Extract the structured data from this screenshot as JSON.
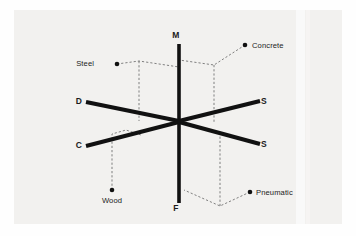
{
  "figure": {
    "background_color": "#f2f1ef",
    "frame_color": "#fdfdfd",
    "axis_color": "#111111",
    "dashed_color": "#6b6b6b",
    "marker_color": "#111111",
    "text_color": "#1b1b1b"
  },
  "axes": [
    {
      "id": "axis-m",
      "label": "M",
      "direction": "up",
      "label_x": 176,
      "label_y": 38,
      "x1": 179,
      "y1": 44,
      "x2": 179,
      "y2": 120
    },
    {
      "id": "axis-f",
      "label": "F",
      "direction": "down",
      "label_x": 176,
      "label_y": 211,
      "x1": 179,
      "y1": 120,
      "x2": 179,
      "y2": 203
    },
    {
      "id": "axis-d",
      "label": "D",
      "direction": "upper-left",
      "label_x": 79,
      "label_y": 104,
      "x1": 86,
      "y1": 102,
      "x2": 179,
      "y2": 121
    },
    {
      "id": "axis-s-upper",
      "label": "S",
      "direction": "upper-right",
      "label_x": 264,
      "label_y": 104,
      "x1": 179,
      "y1": 121,
      "x2": 260,
      "y2": 101
    },
    {
      "id": "axis-c",
      "label": "C",
      "direction": "lower-left",
      "label_x": 79,
      "label_y": 148,
      "x1": 86,
      "y1": 146,
      "x2": 179,
      "y2": 122
    },
    {
      "id": "axis-s-lower",
      "label": "S",
      "direction": "lower-right",
      "label_x": 264,
      "label_y": 147,
      "x1": 179,
      "y1": 122,
      "x2": 260,
      "y2": 144
    }
  ],
  "materials": [
    {
      "id": "material-steel",
      "label": "Steel",
      "marker_x": 117,
      "marker_y": 64,
      "label_x": 94,
      "label_y": 66,
      "label_anchor": "end",
      "dashed_path": "M117,64 L139,61 L179,67 M139,61 L139,121"
    },
    {
      "id": "material-concrete",
      "label": "Concrete",
      "marker_x": 245,
      "marker_y": 45,
      "label_x": 252,
      "label_y": 48,
      "label_anchor": "start",
      "dashed_path": "M245,45 L214,65 L179,60 M214,65 L214,122"
    },
    {
      "id": "material-wood",
      "label": "Wood",
      "marker_x": 112,
      "marker_y": 190,
      "label_x": 112,
      "label_y": 203,
      "label_anchor": "middle",
      "dashed_path": "M112,190 L112,134 L126,130 L141,135"
    },
    {
      "id": "material-pneumatic",
      "label": "Pneumatic",
      "marker_x": 250,
      "marker_y": 192,
      "label_x": 256,
      "label_y": 195,
      "label_anchor": "start",
      "dashed_path": "M250,192 L220,206 L184,190 M220,206 L220,131"
    }
  ]
}
